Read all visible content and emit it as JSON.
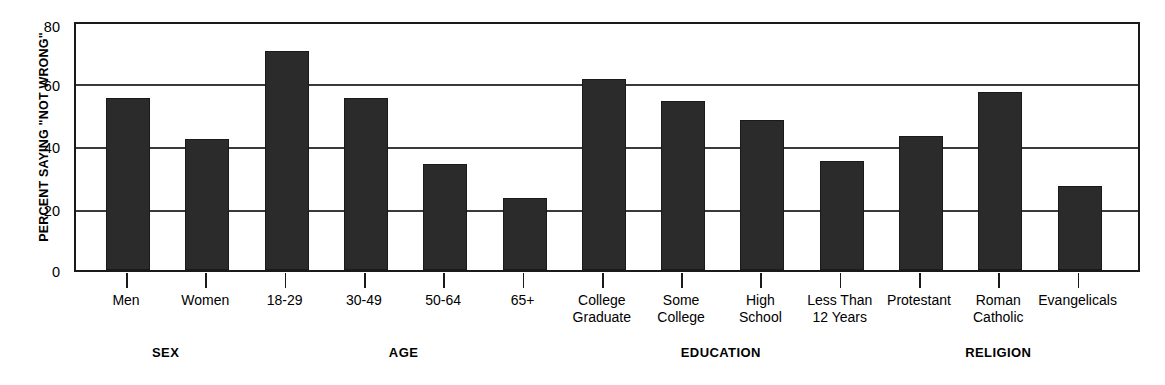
{
  "chart_data": {
    "type": "bar",
    "title": "",
    "xlabel": "",
    "ylabel": "PERCENT SAYING \"NOT WRONG\"",
    "ylim": [
      0,
      80
    ],
    "yticks": [
      0,
      20,
      40,
      60,
      80
    ],
    "grid": true,
    "legend": "none",
    "categories": [
      "Men",
      "Women",
      "18-29",
      "30-49",
      "50-64",
      "65+",
      "College\nGraduate",
      "Some\nCollege",
      "High\nSchool",
      "Less Than\n12 Years",
      "Protestant",
      "Roman\nCatholic",
      "Evangelicals"
    ],
    "values": [
      55,
      42,
      70,
      55,
      34,
      23,
      61,
      54,
      48,
      35,
      43,
      57,
      27
    ],
    "groups": [
      {
        "label": "SEX",
        "categories": [
          "Men",
          "Women"
        ]
      },
      {
        "label": "AGE",
        "categories": [
          "18-29",
          "30-49",
          "50-64",
          "65+"
        ]
      },
      {
        "label": "EDUCATION",
        "categories": [
          "College Graduate",
          "Some College",
          "High School",
          "Less Than 12 Years"
        ]
      },
      {
        "label": "RELIGION",
        "categories": [
          "Protestant",
          "Roman Catholic",
          "Evangelicals"
        ]
      }
    ],
    "bar_color": "#2b2b2b",
    "axis_color": "#1a1a1a",
    "background_color": "#ffffff"
  }
}
